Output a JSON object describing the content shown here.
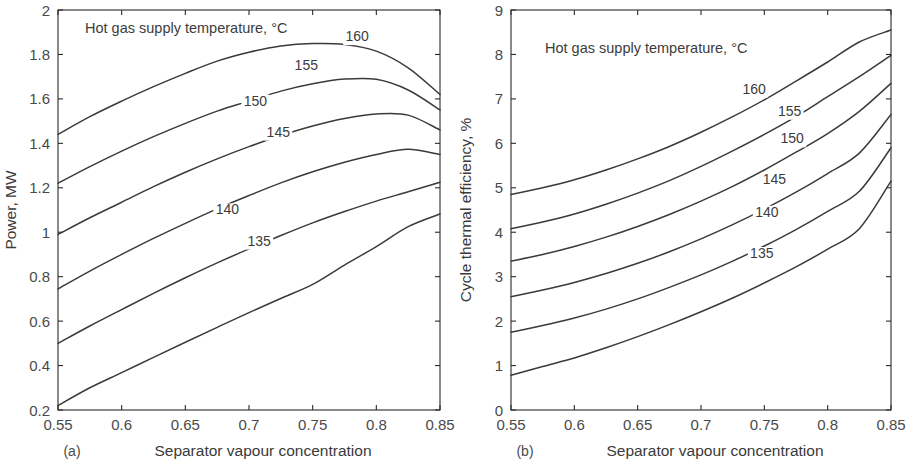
{
  "figure": {
    "background": "#ffffff",
    "line_color": "#3a3a3a",
    "text_color": "#3c3c3c"
  },
  "chart_data": [
    {
      "type": "line",
      "panel": "a",
      "caption": "(a)",
      "title": "Hot gas supply temperature, °C",
      "xlabel": "Separator vapour concentration",
      "ylabel": "Power, MW",
      "xlim": [
        0.55,
        0.85
      ],
      "ylim": [
        0.2,
        2
      ],
      "xticks": [
        0.55,
        0.6,
        0.65,
        0.7,
        0.75,
        0.8,
        0.85
      ],
      "xticklabels": [
        "0.55",
        "0.6",
        "0.65",
        "0.7",
        "0.75",
        "0.8",
        "0.85"
      ],
      "yticks": [
        0.2,
        0.4,
        0.6,
        0.8,
        1,
        1.2,
        1.4,
        1.6,
        1.8,
        2
      ],
      "yticklabels": [
        "0.2",
        "0.4",
        "0.6",
        "0.8",
        "1",
        "1.2",
        "1.4",
        "1.6",
        "1.8",
        "2"
      ],
      "grid": false,
      "legend": "inline-curve-labels",
      "x": [
        0.55,
        0.575,
        0.6,
        0.625,
        0.65,
        0.675,
        0.7,
        0.725,
        0.75,
        0.775,
        0.8,
        0.825,
        0.85
      ],
      "series": [
        {
          "name": "160",
          "label": "160",
          "label_pos": [
            0.785,
            1.86
          ],
          "values": [
            1.44,
            1.52,
            1.59,
            1.655,
            1.715,
            1.77,
            1.81,
            1.838,
            1.849,
            1.845,
            1.815,
            1.74,
            1.62
          ]
        },
        {
          "name": "155",
          "label": "155",
          "label_pos": [
            0.745,
            1.73
          ],
          "values": [
            1.22,
            1.295,
            1.365,
            1.43,
            1.49,
            1.545,
            1.59,
            1.635,
            1.668,
            1.689,
            1.688,
            1.64,
            1.55
          ]
        },
        {
          "name": "150",
          "label": "150",
          "label_pos": [
            0.705,
            1.57
          ],
          "values": [
            0.99,
            1.065,
            1.135,
            1.205,
            1.27,
            1.33,
            1.385,
            1.435,
            1.478,
            1.512,
            1.532,
            1.527,
            1.46
          ]
        },
        {
          "name": "145",
          "label": "145",
          "label_pos": [
            0.723,
            1.43
          ],
          "values": [
            0.745,
            0.825,
            0.9,
            0.972,
            1.04,
            1.105,
            1.165,
            1.222,
            1.272,
            1.315,
            1.35,
            1.373,
            1.35
          ]
        },
        {
          "name": "140",
          "label": "140",
          "label_pos": [
            0.683,
            1.08
          ],
          "values": [
            0.5,
            0.578,
            0.652,
            0.725,
            0.795,
            0.862,
            0.925,
            0.985,
            1.042,
            1.093,
            1.14,
            1.182,
            1.225
          ]
        },
        {
          "name": "135",
          "label": "135",
          "label_pos": [
            0.708,
            0.94
          ],
          "values": [
            0.22,
            0.3,
            0.368,
            0.437,
            0.505,
            0.572,
            0.638,
            0.702,
            0.765,
            0.852,
            0.935,
            1.025,
            1.082
          ]
        }
      ]
    },
    {
      "type": "line",
      "panel": "b",
      "caption": "(b)",
      "title": "Hot gas supply temperature, °C",
      "xlabel": "Separator vapour concentration",
      "ylabel": "Cycle thermal efficiency, %",
      "xlim": [
        0.55,
        0.85
      ],
      "ylim": [
        0,
        9
      ],
      "xticks": [
        0.55,
        0.6,
        0.65,
        0.7,
        0.75,
        0.8,
        0.85
      ],
      "xticklabels": [
        "0.55",
        "0.6",
        "0.65",
        "0.7",
        "0.75",
        "0.8",
        "0.85"
      ],
      "yticks": [
        0,
        1,
        2,
        3,
        4,
        5,
        6,
        7,
        8,
        9
      ],
      "yticklabels": [
        "0",
        "1",
        "2",
        "3",
        "4",
        "5",
        "6",
        "7",
        "8",
        "9"
      ],
      "grid": false,
      "legend": "inline-curve-labels",
      "x": [
        0.55,
        0.575,
        0.6,
        0.625,
        0.65,
        0.675,
        0.7,
        0.725,
        0.75,
        0.775,
        0.8,
        0.825,
        0.85
      ],
      "series": [
        {
          "name": "160",
          "label": "160",
          "label_pos": [
            0.742,
            7.12
          ],
          "values": [
            4.85,
            5.0,
            5.18,
            5.4,
            5.65,
            5.93,
            6.25,
            6.6,
            6.98,
            7.4,
            7.83,
            8.28,
            8.55
          ]
        },
        {
          "name": "155",
          "label": "155",
          "label_pos": [
            0.77,
            6.62
          ],
          "values": [
            4.08,
            4.23,
            4.41,
            4.63,
            4.88,
            5.16,
            5.48,
            5.83,
            6.2,
            6.6,
            7.05,
            7.5,
            7.98
          ]
        },
        {
          "name": "150",
          "label": "150",
          "label_pos": [
            0.772,
            6.0
          ],
          "values": [
            3.35,
            3.5,
            3.68,
            3.89,
            4.13,
            4.4,
            4.7,
            5.03,
            5.4,
            5.8,
            6.22,
            6.72,
            7.35
          ]
        },
        {
          "name": "145",
          "label": "145",
          "label_pos": [
            0.758,
            5.08
          ],
          "values": [
            2.55,
            2.7,
            2.87,
            3.07,
            3.3,
            3.56,
            3.85,
            4.17,
            4.52,
            4.9,
            5.32,
            5.78,
            6.65
          ]
        },
        {
          "name": "140",
          "label": "140",
          "label_pos": [
            0.752,
            4.35
          ],
          "values": [
            1.75,
            1.9,
            2.07,
            2.27,
            2.5,
            2.76,
            3.04,
            3.35,
            3.69,
            4.06,
            4.47,
            4.92,
            5.9
          ]
        },
        {
          "name": "135",
          "label": "135",
          "label_pos": [
            0.748,
            3.42
          ],
          "values": [
            0.78,
            0.98,
            1.17,
            1.4,
            1.65,
            1.92,
            2.21,
            2.52,
            2.86,
            3.22,
            3.62,
            4.08,
            5.15
          ]
        }
      ]
    }
  ]
}
